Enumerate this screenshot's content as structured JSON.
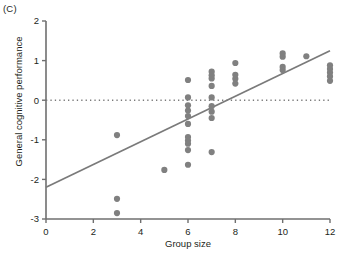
{
  "panel": {
    "label": "(C)"
  },
  "chart_data": {
    "type": "scatter",
    "title": "",
    "subtitle": "",
    "xlabel": "Group size",
    "ylabel": "General cognitive performance",
    "xlim": [
      0,
      12
    ],
    "ylim": [
      -3,
      2
    ],
    "xticks": [
      0,
      2,
      4,
      6,
      8,
      10,
      12
    ],
    "yticks": [
      2,
      1,
      0,
      -1,
      -2,
      -3
    ],
    "xtick_labels": [
      "0",
      "2",
      "4",
      "6",
      "8",
      "10",
      "12"
    ],
    "ytick_labels": [
      "2",
      "1",
      "0",
      "-1",
      "-2",
      "-3"
    ],
    "grid": false,
    "legend": null,
    "marker": {
      "shape": "circle",
      "color": "#808080",
      "size": 5
    },
    "points": [
      {
        "x": 3,
        "y": -0.88
      },
      {
        "x": 3,
        "y": -2.49
      },
      {
        "x": 3,
        "y": -2.85
      },
      {
        "x": 5,
        "y": -1.76
      },
      {
        "x": 6,
        "y": 0.51
      },
      {
        "x": 6,
        "y": 0.07
      },
      {
        "x": 6,
        "y": -0.13
      },
      {
        "x": 6,
        "y": -0.26
      },
      {
        "x": 6,
        "y": -0.4
      },
      {
        "x": 6,
        "y": -0.6
      },
      {
        "x": 6,
        "y": -0.93
      },
      {
        "x": 6,
        "y": -1.02
      },
      {
        "x": 6,
        "y": -1.1
      },
      {
        "x": 6,
        "y": -1.26
      },
      {
        "x": 6,
        "y": -1.63
      },
      {
        "x": 7,
        "y": 0.72
      },
      {
        "x": 7,
        "y": 0.63
      },
      {
        "x": 7,
        "y": 0.55
      },
      {
        "x": 7,
        "y": 0.36
      },
      {
        "x": 7,
        "y": 0.07
      },
      {
        "x": 7,
        "y": -0.15
      },
      {
        "x": 7,
        "y": -0.29
      },
      {
        "x": 7,
        "y": -0.45
      },
      {
        "x": 7,
        "y": -1.31
      },
      {
        "x": 8,
        "y": 0.94
      },
      {
        "x": 8,
        "y": 0.64
      },
      {
        "x": 8,
        "y": 0.54
      },
      {
        "x": 8,
        "y": 0.42
      },
      {
        "x": 10,
        "y": 1.18
      },
      {
        "x": 10,
        "y": 1.1
      },
      {
        "x": 10,
        "y": 0.84
      },
      {
        "x": 10,
        "y": 0.76
      },
      {
        "x": 11,
        "y": 1.11
      },
      {
        "x": 12,
        "y": 0.88
      },
      {
        "x": 12,
        "y": 0.79
      },
      {
        "x": 12,
        "y": 0.7
      },
      {
        "x": 12,
        "y": 0.6
      },
      {
        "x": 12,
        "y": 0.49
      }
    ],
    "reference_line": {
      "orientation": "horizontal",
      "y": 0,
      "style": "dotted",
      "color": "#7a7a7a"
    },
    "fit_line": {
      "type": "linear",
      "x0": 0,
      "y0": -2.2,
      "x1": 12,
      "y1": 1.25,
      "color": "#7a7a7a"
    }
  }
}
